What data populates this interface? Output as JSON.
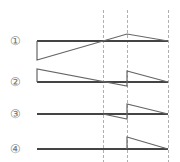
{
  "figure": {
    "width": 180,
    "height": 162,
    "colors": {
      "baseline": "#444444",
      "graph": "#666666",
      "dashed": "#b0b0b0",
      "label": "#777777"
    },
    "dashed_x": [
      103,
      127,
      168
    ],
    "x_start": 37,
    "x_end": 168
  },
  "rows": [
    {
      "label": "①",
      "label_y": 41,
      "baseline_y": 41,
      "path": [
        [
          37,
          41
        ],
        [
          37,
          60
        ],
        [
          103,
          41
        ],
        [
          127,
          34
        ],
        [
          168,
          41
        ]
      ]
    },
    {
      "label": "②",
      "label_y": 82,
      "baseline_y": 82,
      "path": [
        [
          37,
          82
        ],
        [
          37,
          69
        ],
        [
          127,
          86
        ],
        [
          127,
          71
        ],
        [
          168,
          82
        ]
      ]
    },
    {
      "label": "③",
      "label_y": 114,
      "baseline_y": 114,
      "path": [
        [
          103,
          114
        ],
        [
          127,
          119
        ],
        [
          127,
          104
        ],
        [
          168,
          114
        ]
      ]
    },
    {
      "label": "④",
      "label_y": 149,
      "baseline_y": 149,
      "path": [
        [
          127,
          149
        ],
        [
          127,
          137
        ],
        [
          168,
          149
        ]
      ]
    }
  ]
}
